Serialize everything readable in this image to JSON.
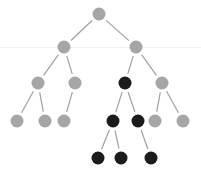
{
  "diagram": {
    "type": "tree",
    "colors": {
      "background": "#ffffff",
      "node_default": "#a6a6a6",
      "node_highlight": "#1c1c1c",
      "edge": "#a0a0a0",
      "guide_line": "#f1f1f1"
    },
    "node_radius": 6.5,
    "nodes": [
      {
        "id": "n0",
        "x": 99,
        "y": 14,
        "highlight": false
      },
      {
        "id": "n1",
        "x": 64,
        "y": 47,
        "highlight": false
      },
      {
        "id": "n2",
        "x": 136,
        "y": 47,
        "highlight": false
      },
      {
        "id": "n3",
        "x": 38,
        "y": 83,
        "highlight": false
      },
      {
        "id": "n4",
        "x": 75,
        "y": 83,
        "highlight": false
      },
      {
        "id": "n5",
        "x": 125,
        "y": 83,
        "highlight": true
      },
      {
        "id": "n6",
        "x": 162,
        "y": 83,
        "highlight": false
      },
      {
        "id": "n7",
        "x": 17,
        "y": 121,
        "highlight": false
      },
      {
        "id": "n8",
        "x": 45,
        "y": 121,
        "highlight": false
      },
      {
        "id": "n9",
        "x": 64,
        "y": 121,
        "highlight": false
      },
      {
        "id": "n10",
        "x": 113,
        "y": 121,
        "highlight": true
      },
      {
        "id": "n11",
        "x": 138,
        "y": 121,
        "highlight": true
      },
      {
        "id": "n12",
        "x": 155,
        "y": 121,
        "highlight": false
      },
      {
        "id": "n13",
        "x": 183,
        "y": 121,
        "highlight": false
      },
      {
        "id": "n14",
        "x": 98,
        "y": 158,
        "highlight": true
      },
      {
        "id": "n15",
        "x": 121,
        "y": 158,
        "highlight": true
      },
      {
        "id": "n16",
        "x": 151,
        "y": 158,
        "highlight": true
      }
    ],
    "edges": [
      [
        "n0",
        "n1"
      ],
      [
        "n0",
        "n2"
      ],
      [
        "n1",
        "n3"
      ],
      [
        "n1",
        "n4"
      ],
      [
        "n2",
        "n5"
      ],
      [
        "n2",
        "n6"
      ],
      [
        "n3",
        "n7"
      ],
      [
        "n3",
        "n8"
      ],
      [
        "n4",
        "n9"
      ],
      [
        "n5",
        "n10"
      ],
      [
        "n5",
        "n11"
      ],
      [
        "n6",
        "n12"
      ],
      [
        "n6",
        "n13"
      ],
      [
        "n10",
        "n14"
      ],
      [
        "n10",
        "n15"
      ],
      [
        "n11",
        "n16"
      ]
    ]
  }
}
